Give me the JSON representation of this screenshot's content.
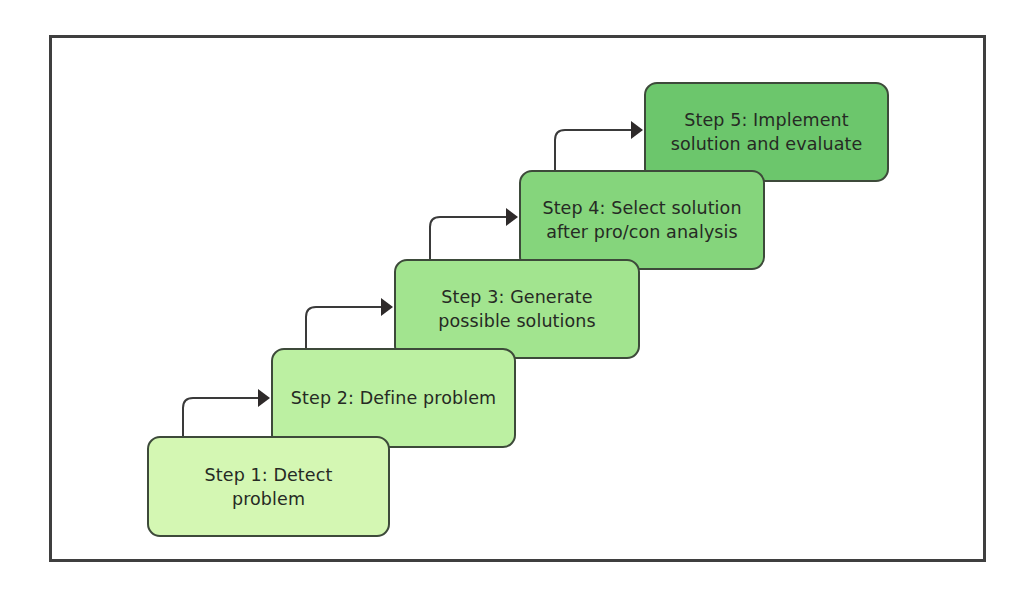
{
  "diagram": {
    "type": "staircase-process",
    "frame_border_color": "#3f3f3f",
    "connector_color": "#3a3a3a",
    "steps": [
      {
        "number": 1,
        "label": "Step 1: Detect\nproblem",
        "color": "#d4f7b3",
        "box": {
          "x": 147,
          "y": 436,
          "w": 243,
          "h": 101
        }
      },
      {
        "number": 2,
        "label": "Step 2: Define problem",
        "color": "#bcf0a2",
        "box": {
          "x": 271,
          "y": 348,
          "w": 245,
          "h": 100
        }
      },
      {
        "number": 3,
        "label": "Step 3: Generate\npossible solutions",
        "color": "#a2e48f",
        "box": {
          "x": 394,
          "y": 259,
          "w": 246,
          "h": 100
        }
      },
      {
        "number": 4,
        "label": "Step 4: Select solution\nafter pro/con analysis",
        "color": "#85d57c",
        "box": {
          "x": 519,
          "y": 170,
          "w": 246,
          "h": 100
        }
      },
      {
        "number": 5,
        "label": "Step 5: Implement\nsolution and evaluate",
        "color": "#6cc66c",
        "box": {
          "x": 644,
          "y": 82,
          "w": 245,
          "h": 100
        }
      }
    ],
    "connectors": [
      {
        "from": 1,
        "to": 2,
        "vx": 183,
        "y_bottom": 436,
        "hy": 398,
        "x_end": 271
      },
      {
        "from": 2,
        "to": 3,
        "vx": 306,
        "y_bottom": 348,
        "hy": 307,
        "x_end": 394
      },
      {
        "from": 3,
        "to": 4,
        "vx": 430,
        "y_bottom": 259,
        "hy": 217,
        "x_end": 519
      },
      {
        "from": 4,
        "to": 5,
        "vx": 555,
        "y_bottom": 170,
        "hy": 130,
        "x_end": 644
      }
    ]
  }
}
